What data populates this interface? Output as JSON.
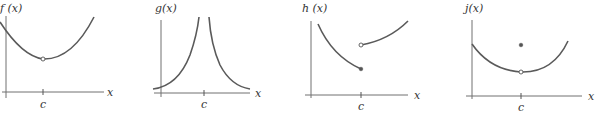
{
  "graphs": [
    {
      "id": "f",
      "ylabel": "f (x)",
      "xlabel": "x",
      "tick_label": "c",
      "description": "Continuous-looking parabola with a removable discontinuity (open circle) at x = c"
    },
    {
      "id": "g",
      "ylabel": "g(x)",
      "xlabel": "x",
      "tick_label": "c",
      "description": "Vertical asymptote at x = c; both branches increase without bound toward c"
    },
    {
      "id": "h",
      "ylabel": "h (x)",
      "xlabel": "x",
      "tick_label": "c",
      "description": "Jump discontinuity at x = c: left branch ends in filled dot, right branch begins with open circle above"
    },
    {
      "id": "j",
      "ylabel": "j(x)",
      "xlabel": "x",
      "tick_label": "c",
      "description": "Parabola with open circle at x = c and an isolated filled point above it"
    }
  ],
  "colors": {
    "curve": "#5a5a5a",
    "axis": "#707070",
    "background": "#ffffff"
  }
}
